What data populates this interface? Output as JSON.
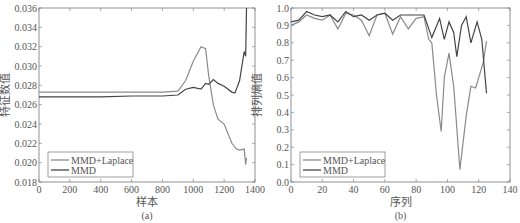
{
  "chart_data": [
    {
      "type": "line",
      "caption": "(a)",
      "title": "",
      "xlabel": "样本",
      "ylabel": "特征数值",
      "xlim": [
        0,
        1400
      ],
      "ylim": [
        0.018,
        0.036
      ],
      "xticks": [
        "0",
        "200",
        "400",
        "600",
        "800",
        "1000",
        "1200",
        "1400"
      ],
      "yticks": [
        "0.018",
        "0.020",
        "0.022",
        "0.024",
        "0.026",
        "0.028",
        "0.030",
        "0.032",
        "0.034",
        "0.036"
      ],
      "grid": false,
      "legend": {
        "position": "lower-left",
        "entries": [
          "MMD+Laplace",
          "MMD"
        ]
      },
      "series": [
        {
          "name": "MMD+Laplace",
          "x": [
            0,
            200,
            400,
            600,
            800,
            900,
            950,
            1000,
            1050,
            1080,
            1100,
            1130,
            1160,
            1200,
            1250,
            1280,
            1300,
            1330,
            1340,
            1345
          ],
          "values": [
            0.0273,
            0.0273,
            0.0273,
            0.0273,
            0.0273,
            0.0274,
            0.0285,
            0.0305,
            0.032,
            0.0318,
            0.029,
            0.026,
            0.0245,
            0.024,
            0.022,
            0.0214,
            0.0213,
            0.0214,
            0.0198,
            0.0205
          ]
        },
        {
          "name": "MMD",
          "x": [
            0,
            200,
            400,
            600,
            800,
            900,
            950,
            1000,
            1050,
            1080,
            1100,
            1130,
            1160,
            1200,
            1250,
            1270,
            1300,
            1330,
            1340,
            1345
          ],
          "values": [
            0.0268,
            0.0268,
            0.0268,
            0.0269,
            0.0269,
            0.027,
            0.0276,
            0.0278,
            0.0276,
            0.0282,
            0.0281,
            0.0286,
            0.0282,
            0.0279,
            0.0273,
            0.0272,
            0.0285,
            0.0315,
            0.031,
            0.036
          ]
        }
      ]
    },
    {
      "type": "line",
      "caption": "(b)",
      "title": "",
      "xlabel": "序列",
      "ylabel": "排列熵值",
      "xlim": [
        0,
        140
      ],
      "ylim": [
        0.0,
        1.0
      ],
      "xticks": [
        "0",
        "20",
        "40",
        "60",
        "80",
        "100",
        "120",
        "140"
      ],
      "yticks": [
        "0.0",
        "0.1",
        "0.2",
        "0.3",
        "0.4",
        "0.5",
        "0.6",
        "0.7",
        "0.8",
        "0.9",
        "1.0"
      ],
      "grid": false,
      "legend": {
        "position": "lower-left",
        "entries": [
          "MMD+Laplace",
          "MMD"
        ]
      },
      "series": [
        {
          "name": "MMD+Laplace",
          "x": [
            0,
            5,
            10,
            15,
            20,
            25,
            30,
            35,
            40,
            45,
            50,
            55,
            60,
            65,
            70,
            75,
            80,
            85,
            88,
            90,
            93,
            96,
            98,
            101,
            104,
            108,
            112,
            115,
            118,
            120,
            123,
            125
          ],
          "values": [
            0.9,
            0.92,
            0.96,
            0.94,
            0.93,
            0.96,
            0.88,
            0.97,
            0.96,
            0.93,
            0.84,
            0.96,
            0.97,
            0.85,
            0.95,
            0.88,
            0.94,
            0.95,
            0.82,
            0.8,
            0.5,
            0.29,
            0.6,
            0.74,
            0.55,
            0.07,
            0.38,
            0.55,
            0.54,
            0.6,
            0.69,
            0.81
          ]
        },
        {
          "name": "MMD",
          "x": [
            0,
            5,
            10,
            15,
            20,
            25,
            30,
            35,
            40,
            45,
            50,
            55,
            60,
            65,
            70,
            75,
            80,
            85,
            90,
            95,
            98,
            101,
            104,
            106,
            109,
            112,
            115,
            119,
            122,
            125
          ],
          "values": [
            0.92,
            0.93,
            0.98,
            0.96,
            0.95,
            0.96,
            0.92,
            0.98,
            0.95,
            0.96,
            0.93,
            0.96,
            0.97,
            0.93,
            0.96,
            0.96,
            0.96,
            0.96,
            0.83,
            0.94,
            0.82,
            0.92,
            0.86,
            0.72,
            0.9,
            0.95,
            0.8,
            0.92,
            0.82,
            0.51
          ]
        }
      ]
    }
  ]
}
